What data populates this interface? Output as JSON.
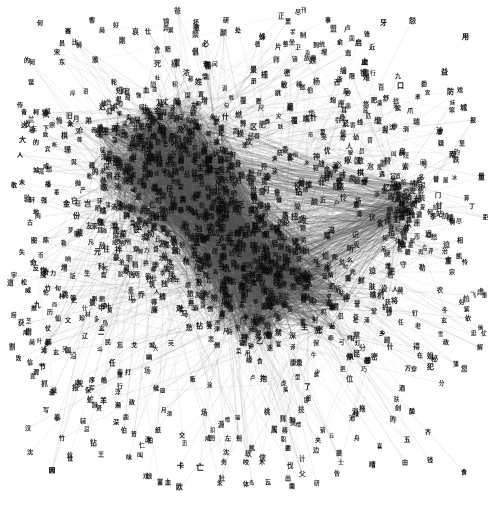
{
  "figure": {
    "title": "",
    "type": "network-graph",
    "background_color": "#ffffff",
    "width": 498,
    "height": 516
  },
  "style": {
    "edge_color": "#7d7d7d",
    "edge_opacity": 0.3,
    "edge_width": 0.4,
    "node_label_color": "#0b0b0b",
    "node_font_size_min": 5,
    "node_font_size_max": 9
  },
  "chart_data": {
    "type": "scatter",
    "title": "",
    "xlabel": "",
    "ylabel": "",
    "grid": false,
    "legend": null,
    "xlim": [
      0,
      498
    ],
    "ylim": [
      0,
      516
    ],
    "clusters": [
      {
        "name": "upper-left-core",
        "cx": 165,
        "cy": 160,
        "rx": 95,
        "ry": 85,
        "density": 1.0
      },
      {
        "name": "lower-center-core",
        "cx": 270,
        "cy": 290,
        "rx": 105,
        "ry": 80,
        "density": 0.95
      },
      {
        "name": "right-hub",
        "cx": 408,
        "cy": 205,
        "rx": 34,
        "ry": 52,
        "density": 0.7
      },
      {
        "name": "bridge",
        "cx": 225,
        "cy": 225,
        "rx": 70,
        "ry": 45,
        "density": 0.6
      }
    ],
    "node_count": 1180,
    "edge_count": 5200,
    "nodes": [
      {
        "label": "何",
        "x": 40,
        "y": 23,
        "size": 6
      },
      {
        "label": "赛",
        "x": 68,
        "y": 31,
        "size": 6
      },
      {
        "label": "客",
        "x": 92,
        "y": 20,
        "size": 6
      },
      {
        "label": "员",
        "x": 62,
        "y": 43,
        "size": 6
      },
      {
        "label": "的",
        "x": 27,
        "y": 60,
        "size": 6
      },
      {
        "label": "宋",
        "x": 57,
        "y": 52,
        "size": 6
      },
      {
        "label": "东",
        "x": 62,
        "y": 62,
        "size": 6
      },
      {
        "label": "误",
        "x": 31,
        "y": 82,
        "size": 6
      },
      {
        "label": "比",
        "x": 75,
        "y": 42,
        "size": 6
      },
      {
        "label": "尚",
        "x": 102,
        "y": 30,
        "size": 6
      },
      {
        "label": "仕",
        "x": 148,
        "y": 31,
        "size": 6
      },
      {
        "label": "弄",
        "x": 166,
        "y": 28,
        "size": 6
      },
      {
        "label": "好",
        "x": 116,
        "y": 25,
        "size": 6
      },
      {
        "label": "坏",
        "x": 196,
        "y": 22,
        "size": 6
      },
      {
        "label": "研",
        "x": 226,
        "y": 20,
        "size": 6
      },
      {
        "label": "处",
        "x": 238,
        "y": 30,
        "size": 6
      },
      {
        "label": "里",
        "x": 288,
        "y": 21,
        "size": 6
      },
      {
        "label": "事",
        "x": 328,
        "y": 20,
        "size": 6
      },
      {
        "label": "牙",
        "x": 383,
        "y": 23,
        "size": 7
      },
      {
        "label": "怨",
        "x": 412,
        "y": 21,
        "size": 7
      },
      {
        "label": "俞",
        "x": 340,
        "y": 42,
        "size": 6
      },
      {
        "label": "启",
        "x": 358,
        "y": 43,
        "size": 7
      },
      {
        "label": "制",
        "x": 303,
        "y": 35,
        "size": 6
      },
      {
        "label": "到",
        "x": 316,
        "y": 45,
        "size": 6
      },
      {
        "label": "近",
        "x": 372,
        "y": 47,
        "size": 6
      },
      {
        "label": "用",
        "x": 465,
        "y": 37,
        "size": 7
      },
      {
        "label": "止",
        "x": 364,
        "y": 62,
        "size": 7
      },
      {
        "label": "限",
        "x": 352,
        "y": 76,
        "size": 6
      },
      {
        "label": "益",
        "x": 444,
        "y": 72,
        "size": 7
      },
      {
        "label": "西",
        "x": 337,
        "y": 82,
        "size": 6
      },
      {
        "label": "妙",
        "x": 348,
        "y": 93,
        "size": 6
      },
      {
        "label": "防",
        "x": 450,
        "y": 92,
        "size": 7
      },
      {
        "label": "戏",
        "x": 460,
        "y": 90,
        "size": 6
      },
      {
        "label": "肥",
        "x": 374,
        "y": 100,
        "size": 6
      },
      {
        "label": "舒",
        "x": 386,
        "y": 98,
        "size": 6
      },
      {
        "label": "口",
        "x": 400,
        "y": 86,
        "size": 7
      },
      {
        "label": "耳",
        "x": 344,
        "y": 110,
        "size": 6
      },
      {
        "label": "挨",
        "x": 398,
        "y": 108,
        "size": 6
      },
      {
        "label": "城",
        "x": 463,
        "y": 108,
        "size": 7
      },
      {
        "label": "报",
        "x": 473,
        "y": 120,
        "size": 6
      },
      {
        "label": "引",
        "x": 338,
        "y": 120,
        "size": 6
      },
      {
        "label": "线",
        "x": 360,
        "y": 122,
        "size": 6
      },
      {
        "label": "沈",
        "x": 392,
        "y": 127,
        "size": 6
      },
      {
        "label": "消",
        "x": 406,
        "y": 129,
        "size": 6
      },
      {
        "label": "爹",
        "x": 440,
        "y": 132,
        "size": 6
      },
      {
        "label": "疑",
        "x": 441,
        "y": 143,
        "size": 6
      },
      {
        "label": "南",
        "x": 452,
        "y": 155,
        "size": 7
      },
      {
        "label": "至",
        "x": 462,
        "y": 143,
        "size": 6
      },
      {
        "label": "何",
        "x": 430,
        "y": 212,
        "size": 6
      },
      {
        "label": "柏",
        "x": 452,
        "y": 220,
        "size": 6
      },
      {
        "label": "相",
        "x": 460,
        "y": 240,
        "size": 6
      },
      {
        "label": "丁",
        "x": 472,
        "y": 206,
        "size": 6
      },
      {
        "label": "门",
        "x": 438,
        "y": 195,
        "size": 6
      },
      {
        "label": "宗",
        "x": 452,
        "y": 272,
        "size": 6
      },
      {
        "label": "农",
        "x": 440,
        "y": 290,
        "size": 6
      },
      {
        "label": "怜",
        "x": 465,
        "y": 262,
        "size": 6
      },
      {
        "label": "好",
        "x": 462,
        "y": 302,
        "size": 6
      },
      {
        "label": "玄",
        "x": 444,
        "y": 320,
        "size": 6
      },
      {
        "label": "依",
        "x": 468,
        "y": 318,
        "size": 6
      },
      {
        "label": "政",
        "x": 446,
        "y": 342,
        "size": 6
      },
      {
        "label": "在",
        "x": 420,
        "y": 355,
        "size": 6
      },
      {
        "label": "万",
        "x": 408,
        "y": 368,
        "size": 6
      },
      {
        "label": "酒",
        "x": 402,
        "y": 388,
        "size": 6
      },
      {
        "label": "剑",
        "x": 398,
        "y": 408,
        "size": 6
      },
      {
        "label": "齐",
        "x": 428,
        "y": 432,
        "size": 6
      },
      {
        "label": "钱",
        "x": 430,
        "y": 460,
        "size": 6
      },
      {
        "label": "食",
        "x": 464,
        "y": 472,
        "size": 6
      },
      {
        "label": "由",
        "x": 405,
        "y": 462,
        "size": 6
      },
      {
        "label": "池",
        "x": 352,
        "y": 418,
        "size": 6
      },
      {
        "label": "到",
        "x": 292,
        "y": 420,
        "size": 6
      },
      {
        "label": "夹",
        "x": 318,
        "y": 440,
        "size": 6
      },
      {
        "label": "要",
        "x": 288,
        "y": 448,
        "size": 6
      },
      {
        "label": "出",
        "x": 288,
        "y": 478,
        "size": 6
      },
      {
        "label": "木",
        "x": 262,
        "y": 462,
        "size": 6
      },
      {
        "label": "亡",
        "x": 200,
        "y": 468,
        "size": 8
      },
      {
        "label": "卡",
        "x": 180,
        "y": 466,
        "size": 7
      },
      {
        "label": "血",
        "x": 168,
        "y": 482,
        "size": 6
      },
      {
        "label": "叫",
        "x": 140,
        "y": 455,
        "size": 6
      },
      {
        "label": "牡",
        "x": 222,
        "y": 478,
        "size": 6
      },
      {
        "label": "体",
        "x": 246,
        "y": 484,
        "size": 6
      },
      {
        "label": "瓦",
        "x": 268,
        "y": 482,
        "size": 6
      },
      {
        "label": "南",
        "x": 292,
        "y": 486,
        "size": 6
      },
      {
        "label": "沈",
        "x": 226,
        "y": 452,
        "size": 6
      },
      {
        "label": "咬",
        "x": 246,
        "y": 462,
        "size": 6
      },
      {
        "label": "凯",
        "x": 252,
        "y": 448,
        "size": 6
      },
      {
        "label": "成",
        "x": 208,
        "y": 438,
        "size": 6
      },
      {
        "label": "左",
        "x": 228,
        "y": 438,
        "size": 6
      },
      {
        "label": "仁",
        "x": 142,
        "y": 445,
        "size": 6
      },
      {
        "label": "田",
        "x": 212,
        "y": 438,
        "size": 6
      },
      {
        "label": "交",
        "x": 182,
        "y": 435,
        "size": 6
      },
      {
        "label": "纸",
        "x": 158,
        "y": 430,
        "size": 6
      },
      {
        "label": "网",
        "x": 52,
        "y": 470,
        "size": 6
      },
      {
        "label": "沈",
        "x": 30,
        "y": 452,
        "size": 6
      },
      {
        "label": "位",
        "x": 70,
        "y": 455,
        "size": 6
      },
      {
        "label": "因",
        "x": 52,
        "y": 470,
        "size": 6
      },
      {
        "label": "汉",
        "x": 28,
        "y": 428,
        "size": 6
      },
      {
        "label": "竹",
        "x": 62,
        "y": 438,
        "size": 6
      },
      {
        "label": "位",
        "x": 70,
        "y": 458,
        "size": 6
      },
      {
        "label": "写",
        "x": 46,
        "y": 410,
        "size": 6
      },
      {
        "label": "盗",
        "x": 52,
        "y": 392,
        "size": 6
      },
      {
        "label": "益",
        "x": 54,
        "y": 390,
        "size": 6
      },
      {
        "label": "内",
        "x": 78,
        "y": 382,
        "size": 6
      },
      {
        "label": "序",
        "x": 92,
        "y": 380,
        "size": 6
      },
      {
        "label": "保",
        "x": 88,
        "y": 390,
        "size": 6
      },
      {
        "label": "皓",
        "x": 104,
        "y": 380,
        "size": 6
      },
      {
        "label": "浮",
        "x": 118,
        "y": 392,
        "size": 6
      },
      {
        "label": "妾",
        "x": 120,
        "y": 372,
        "size": 6
      },
      {
        "label": "打",
        "x": 128,
        "y": 372,
        "size": 6
      },
      {
        "label": "候",
        "x": 156,
        "y": 388,
        "size": 6
      },
      {
        "label": "濒",
        "x": 118,
        "y": 405,
        "size": 6
      },
      {
        "label": "政",
        "x": 132,
        "y": 402,
        "size": 6
      },
      {
        "label": "深",
        "x": 116,
        "y": 422,
        "size": 6
      },
      {
        "label": "伯",
        "x": 124,
        "y": 430,
        "size": 6
      },
      {
        "label": "柏",
        "x": 150,
        "y": 440,
        "size": 6
      },
      {
        "label": "滩",
        "x": 44,
        "y": 350,
        "size": 6
      },
      {
        "label": "玄",
        "x": 56,
        "y": 352,
        "size": 6
      },
      {
        "label": "国",
        "x": 68,
        "y": 350,
        "size": 6
      },
      {
        "label": "民",
        "x": 108,
        "y": 342,
        "size": 6
      },
      {
        "label": "忘",
        "x": 120,
        "y": 345,
        "size": 6
      },
      {
        "label": "戈",
        "x": 134,
        "y": 345,
        "size": 6
      },
      {
        "label": "城",
        "x": 152,
        "y": 345,
        "size": 6
      },
      {
        "label": "信",
        "x": 30,
        "y": 362,
        "size": 6
      },
      {
        "label": "谓",
        "x": 36,
        "y": 372,
        "size": 6
      },
      {
        "label": "宇",
        "x": 14,
        "y": 275,
        "size": 6
      },
      {
        "label": "城",
        "x": 36,
        "y": 170,
        "size": 6
      },
      {
        "label": "成",
        "x": 46,
        "y": 166,
        "size": 6
      },
      {
        "label": "未",
        "x": 22,
        "y": 182,
        "size": 6
      },
      {
        "label": "播",
        "x": 48,
        "y": 184,
        "size": 6
      },
      {
        "label": "轩",
        "x": 32,
        "y": 200,
        "size": 6
      },
      {
        "label": "强",
        "x": 44,
        "y": 200,
        "size": 6
      },
      {
        "label": "地",
        "x": 36,
        "y": 212,
        "size": 6
      },
      {
        "label": "古",
        "x": 30,
        "y": 222,
        "size": 6
      },
      {
        "label": "图",
        "x": 34,
        "y": 240,
        "size": 6
      },
      {
        "label": "陈",
        "x": 46,
        "y": 240,
        "size": 6
      },
      {
        "label": "失",
        "x": 22,
        "y": 252,
        "size": 6
      },
      {
        "label": "反",
        "x": 36,
        "y": 268,
        "size": 6
      },
      {
        "label": "奇",
        "x": 46,
        "y": 272,
        "size": 6
      },
      {
        "label": "松",
        "x": 24,
        "y": 282,
        "size": 6
      },
      {
        "label": "伦",
        "x": 46,
        "y": 292,
        "size": 6
      },
      {
        "label": "推",
        "x": 34,
        "y": 308,
        "size": 6
      },
      {
        "label": "历",
        "x": 50,
        "y": 312,
        "size": 6
      },
      {
        "label": "仗",
        "x": 48,
        "y": 328,
        "size": 6
      },
      {
        "label": "成",
        "x": 26,
        "y": 332,
        "size": 6
      },
      {
        "label": "尚",
        "x": 32,
        "y": 342,
        "size": 6
      },
      {
        "label": "部",
        "x": 48,
        "y": 342,
        "size": 6
      },
      {
        "label": "何",
        "x": 32,
        "y": 62,
        "size": 6
      },
      {
        "label": "传",
        "x": 20,
        "y": 105,
        "size": 6
      },
      {
        "label": "这",
        "x": 24,
        "y": 125,
        "size": 6
      },
      {
        "label": "大",
        "x": 22,
        "y": 140,
        "size": 7
      },
      {
        "label": "的",
        "x": 36,
        "y": 142,
        "size": 6
      },
      {
        "label": "人",
        "x": 20,
        "y": 155,
        "size": 6
      },
      {
        "label": "左",
        "x": 34,
        "y": 128,
        "size": 6
      },
      {
        "label": "下",
        "x": 46,
        "y": 128,
        "size": 6
      },
      {
        "label": "青",
        "x": 24,
        "y": 112,
        "size": 6
      },
      {
        "label": "柯",
        "x": 36,
        "y": 112,
        "size": 6
      },
      {
        "label": "村",
        "x": 62,
        "y": 296,
        "size": 6
      },
      {
        "label": "史",
        "x": 74,
        "y": 300,
        "size": 6
      },
      {
        "label": "仙",
        "x": 58,
        "y": 318,
        "size": 6
      },
      {
        "label": "文",
        "x": 68,
        "y": 320,
        "size": 6
      },
      {
        "label": "珍",
        "x": 82,
        "y": 318,
        "size": 6
      },
      {
        "label": "竹",
        "x": 48,
        "y": 288,
        "size": 6
      },
      {
        "label": "句",
        "x": 58,
        "y": 288,
        "size": 6
      },
      {
        "label": "威",
        "x": 28,
        "y": 290,
        "size": 6
      }
    ]
  },
  "nodes_note": "Labels are single Chinese characters; periphery labels legible, core labels occluded by edge density."
}
